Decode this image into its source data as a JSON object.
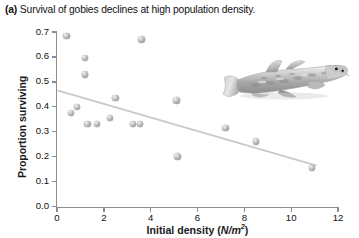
{
  "caption": {
    "panel_label": "(a)",
    "text": "Survival of gobies declines at high population density."
  },
  "axes": {
    "y_title": "Proportion surviving",
    "x_title_main": "Initial density (",
    "x_title_italic": "N/m",
    "x_title_sup": "2",
    "x_title_close": ")",
    "y_ticks": [
      "0.0",
      "0.1",
      "0.2",
      "0.3",
      "0.4",
      "0.5",
      "0.6",
      "0.7"
    ],
    "x_ticks": [
      "0",
      "2",
      "4",
      "6",
      "8",
      "10",
      "12"
    ]
  },
  "inset": {
    "image_name": "goby-fish-photo",
    "alt": "Photograph of a goby fish resting on sand"
  },
  "colors": {
    "axis": "#8d8d8d",
    "marker_fill": "#b0b0b0",
    "marker_highlight": "#f2f2f2",
    "trendline": "#c9c9c9",
    "text": "#111111",
    "background": "#ffffff"
  },
  "chart_data": {
    "type": "scatter",
    "title": "Survival of gobies declines at high population density.",
    "xlabel": "Initial density (N/m2)",
    "ylabel": "Proportion surviving",
    "xlim": [
      0,
      12
    ],
    "ylim": [
      0.0,
      0.7
    ],
    "x_ticks": [
      0,
      2,
      4,
      6,
      8,
      10,
      12
    ],
    "y_ticks": [
      0.0,
      0.1,
      0.2,
      0.3,
      0.4,
      0.5,
      0.6,
      0.7
    ],
    "grid": false,
    "legend": "none",
    "points": [
      {
        "x": 0.4,
        "y": 0.685
      },
      {
        "x": 1.2,
        "y": 0.595
      },
      {
        "x": 1.2,
        "y": 0.53
      },
      {
        "x": 3.6,
        "y": 0.67
      },
      {
        "x": 0.85,
        "y": 0.4
      },
      {
        "x": 0.6,
        "y": 0.375
      },
      {
        "x": 1.3,
        "y": 0.33
      },
      {
        "x": 1.7,
        "y": 0.33
      },
      {
        "x": 2.5,
        "y": 0.435
      },
      {
        "x": 2.25,
        "y": 0.355
      },
      {
        "x": 3.25,
        "y": 0.33
      },
      {
        "x": 3.55,
        "y": 0.33
      },
      {
        "x": 5.1,
        "y": 0.425
      },
      {
        "x": 5.15,
        "y": 0.2
      },
      {
        "x": 7.2,
        "y": 0.315
      },
      {
        "x": 8.5,
        "y": 0.26
      },
      {
        "x": 10.9,
        "y": 0.155
      }
    ],
    "trendline": {
      "type": "linear-fit",
      "x_start": 0.05,
      "y_start": 0.465,
      "x_end": 11.05,
      "y_end": 0.165,
      "slope": -0.0273,
      "intercept": 0.466
    }
  }
}
